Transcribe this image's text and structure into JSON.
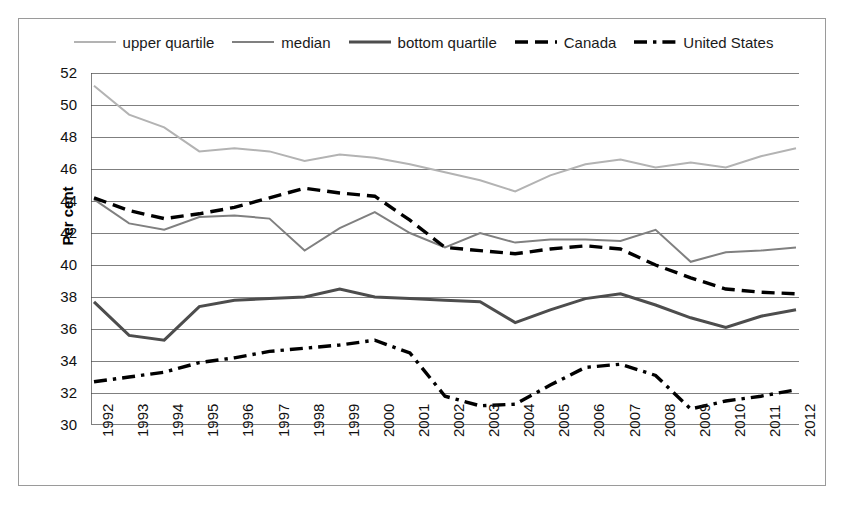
{
  "chart_data": {
    "type": "line",
    "title": "",
    "xlabel": "",
    "ylabel": "Per cent",
    "ylim": [
      30,
      52
    ],
    "ytick_step": 2,
    "yticks": [
      52,
      50,
      48,
      46,
      44,
      42,
      40,
      38,
      36,
      34,
      32,
      30
    ],
    "grid": true,
    "legend_position": "top-center",
    "categories": [
      "1992",
      "1993",
      "1994",
      "1995",
      "1996",
      "1997",
      "1998",
      "1999",
      "2000",
      "2001",
      "2002",
      "2003",
      "2004",
      "2005",
      "2006",
      "2007",
      "2008",
      "2009",
      "2010",
      "2011",
      "2012"
    ],
    "series": [
      {
        "name": "upper quartile",
        "color": "#b3b3b3",
        "style": "solid",
        "width": 2,
        "values": [
          51.2,
          49.4,
          48.6,
          47.1,
          47.3,
          47.1,
          46.5,
          46.9,
          46.7,
          46.3,
          45.8,
          45.3,
          44.6,
          45.6,
          46.3,
          46.6,
          46.1,
          46.4,
          46.1,
          46.8,
          47.3
        ]
      },
      {
        "name": "median",
        "color": "#808080",
        "style": "solid",
        "width": 2,
        "values": [
          44.1,
          42.6,
          42.2,
          43.0,
          43.1,
          42.9,
          40.9,
          42.3,
          43.3,
          42.0,
          41.1,
          42.0,
          41.4,
          41.6,
          41.6,
          41.5,
          42.2,
          40.2,
          40.8,
          40.9,
          41.1
        ]
      },
      {
        "name": "bottom quartile",
        "color": "#4d4d4d",
        "style": "solid",
        "width": 3,
        "values": [
          37.7,
          35.6,
          35.3,
          37.4,
          37.8,
          37.9,
          38.0,
          38.5,
          38.0,
          37.9,
          37.8,
          37.7,
          36.4,
          37.2,
          37.9,
          38.2,
          37.5,
          36.7,
          36.1,
          36.8,
          37.2
        ]
      },
      {
        "name": "Canada",
        "color": "#000000",
        "style": "dashed",
        "width": 3.4,
        "values": [
          44.2,
          43.4,
          42.9,
          43.2,
          43.6,
          44.2,
          44.8,
          44.5,
          44.3,
          42.8,
          41.1,
          40.9,
          40.7,
          41.0,
          41.2,
          41.0,
          40.0,
          39.2,
          38.5,
          38.3,
          38.2
        ]
      },
      {
        "name": "United States",
        "color": "#000000",
        "style": "dash-dot",
        "width": 3.4,
        "values": [
          32.7,
          33.0,
          33.3,
          33.9,
          34.2,
          34.6,
          34.8,
          35.0,
          35.3,
          34.5,
          31.8,
          31.2,
          31.3,
          32.5,
          33.6,
          33.8,
          33.1,
          31.0,
          31.5,
          31.8,
          32.2
        ]
      }
    ]
  },
  "legend": {
    "entries": [
      {
        "label": "upper quartile",
        "icon": "line-swatch-light-gray"
      },
      {
        "label": "median",
        "icon": "line-swatch-gray"
      },
      {
        "label": "bottom quartile",
        "icon": "line-swatch-dark-gray"
      },
      {
        "label": "Canada",
        "icon": "line-swatch-dashed-black"
      },
      {
        "label": "United States",
        "icon": "line-swatch-dash-dot-black"
      }
    ]
  },
  "axis": {
    "y_title": "Per cent"
  }
}
